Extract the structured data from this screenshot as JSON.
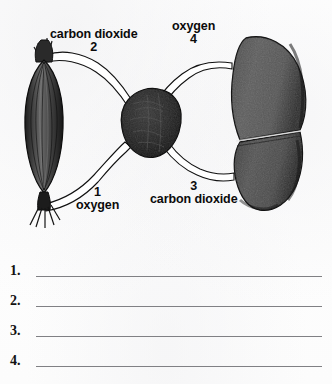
{
  "worksheet": {
    "diagram": {
      "title": "gas exchange between muscle, heart and lungs",
      "organs": [
        {
          "name": "skeletal-muscle",
          "icon": "muscle-icon",
          "position": "left"
        },
        {
          "name": "heart",
          "icon": "heart-icon",
          "position": "center"
        },
        {
          "name": "lung",
          "icon": "lung-icon",
          "position": "right"
        }
      ],
      "labels": [
        {
          "id": "label-1",
          "number": "1",
          "text": "oxygen",
          "position": "bottom-left"
        },
        {
          "id": "label-2",
          "number": "2",
          "text": "carbon dioxide",
          "position": "top-left"
        },
        {
          "id": "label-3",
          "number": "3",
          "text": "carbon dioxide",
          "position": "bottom-right"
        },
        {
          "id": "label-4",
          "number": "4",
          "text": "oxygen",
          "position": "top-right"
        }
      ],
      "colors": {
        "muscle": "#3a3a3a",
        "heart": "#262626",
        "lung": "#585858",
        "vessel_outline": "#111111",
        "vessel_fill": "#ffffff",
        "label_text": "#0b0b0b"
      }
    },
    "answers": [
      {
        "number": "1.",
        "value": ""
      },
      {
        "number": "2.",
        "value": ""
      },
      {
        "number": "3.",
        "value": ""
      },
      {
        "number": "4.",
        "value": ""
      }
    ]
  }
}
